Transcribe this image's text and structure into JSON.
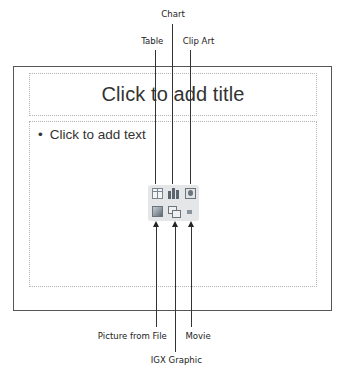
{
  "slide": {
    "title_placeholder": "Click to add title",
    "body_placeholder": "Click to add text",
    "bullet": "•"
  },
  "callouts": {
    "top": [
      {
        "label": "Chart",
        "icon": "chart-icon"
      },
      {
        "label": "Table",
        "icon": "table-icon"
      },
      {
        "label": "Clip Art",
        "icon": "clip-art-icon"
      }
    ],
    "bottom": [
      {
        "label": "Picture from File",
        "icon": "picture-icon"
      },
      {
        "label": "IGX Graphic",
        "icon": "igx-graphic-icon"
      },
      {
        "label": "Movie",
        "icon": "movie-icon"
      }
    ]
  },
  "colors": {
    "slide_border": "#555555",
    "placeholder_border": "#b5b5b5",
    "icon_panel": "#e4e6e8",
    "leader_line": "#333333"
  }
}
